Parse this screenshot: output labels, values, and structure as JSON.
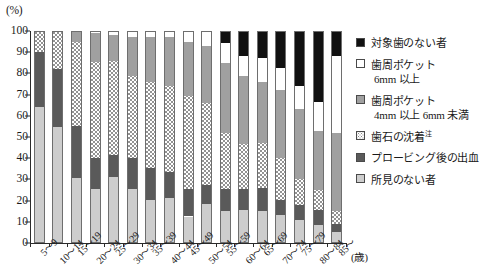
{
  "chart_data": {
    "type": "bar",
    "stacked": true,
    "title": "",
    "xlabel": "(歳)",
    "ylabel": "(%)",
    "ylim": [
      0,
      100
    ],
    "yticks": [
      0,
      10,
      20,
      30,
      40,
      50,
      60,
      70,
      80,
      90,
      100
    ],
    "grid": false,
    "legend_position": "right",
    "categories": [
      "5～9",
      "10～14",
      "15～19",
      "20～24",
      "25～29",
      "30～34",
      "35～39",
      "40～44",
      "45～49",
      "50～54",
      "55～59",
      "60～64",
      "65～69",
      "70～74",
      "75～79",
      "80～84",
      "85～"
    ],
    "series": [
      {
        "name": "所見のない者",
        "key": "none",
        "color": "#cdcdcd",
        "values": [
          64.0,
          54.5,
          30.5,
          25.5,
          31.0,
          25.5,
          20.5,
          21.0,
          12.5,
          18.5,
          15.0,
          15.5,
          15.0,
          13.0,
          11.0,
          8.5,
          5.0
        ]
      },
      {
        "name": "プロービング後の出血",
        "key": "bleeding",
        "color": "#5a5a5a",
        "values": [
          26.0,
          27.5,
          24.5,
          14.5,
          10.5,
          14.5,
          15.0,
          12.5,
          13.0,
          9.0,
          10.5,
          10.0,
          11.0,
          7.5,
          7.0,
          7.0,
          4.0
        ]
      },
      {
        "name": "歯石の沈着",
        "key": "calculus",
        "color": "#ffffff",
        "pattern": "dotted",
        "values": [
          10.0,
          18.0,
          40.0,
          45.5,
          44.5,
          39.0,
          40.5,
          40.5,
          44.0,
          38.5,
          26.5,
          21.0,
          21.0,
          19.5,
          12.0,
          9.5,
          6.0
        ]
      },
      {
        "name": "歯周ポケット 4mm 以上 6mm 未満",
        "key": "pocket4",
        "color": "#a0a0a0",
        "values": [
          0.0,
          0.0,
          5.0,
          13.5,
          12.0,
          18.0,
          21.0,
          23.0,
          25.5,
          27.0,
          33.0,
          32.5,
          29.0,
          32.0,
          33.0,
          28.0,
          37.0
        ]
      },
      {
        "name": "歯周ポケット 6mm 以上",
        "key": "pocket6",
        "color": "#ffffff",
        "values": [
          0.0,
          0.0,
          0.0,
          1.0,
          2.0,
          3.0,
          3.0,
          3.0,
          5.0,
          7.0,
          9.5,
          9.0,
          11.5,
          10.5,
          11.0,
          13.5,
          36.0
        ]
      },
      {
        "name": "対象歯のない者",
        "key": "no-target-teeth",
        "color": "#111111",
        "values": [
          0.0,
          0.0,
          0.0,
          0.0,
          0.0,
          0.0,
          0.0,
          0.0,
          0.0,
          0.0,
          5.5,
          12.0,
          12.5,
          17.5,
          26.0,
          33.5,
          12.0
        ]
      }
    ]
  },
  "axis": {
    "y_unit": "(%)",
    "x_unit": "(歳)",
    "y_tick_labels": [
      "0",
      "10",
      "20",
      "30",
      "40",
      "50",
      "60",
      "70",
      "80",
      "90",
      "100"
    ]
  },
  "legend": {
    "items": [
      {
        "label": "対象歯のない者",
        "label2": "",
        "swatch": "no-target-teeth"
      },
      {
        "label": "歯周ポケット",
        "label2": "6mm 以上",
        "swatch": "pocket6"
      },
      {
        "label": "歯周ポケット",
        "label2": "4mm 以上 6mm 未満",
        "swatch": "pocket4"
      },
      {
        "label": "歯石の沈着",
        "label2": "",
        "swatch": "calculus",
        "note": "注"
      },
      {
        "label": "プロービング後の出血",
        "label2": "",
        "swatch": "bleeding"
      },
      {
        "label": "所見のない者",
        "label2": "",
        "swatch": "none"
      }
    ]
  }
}
